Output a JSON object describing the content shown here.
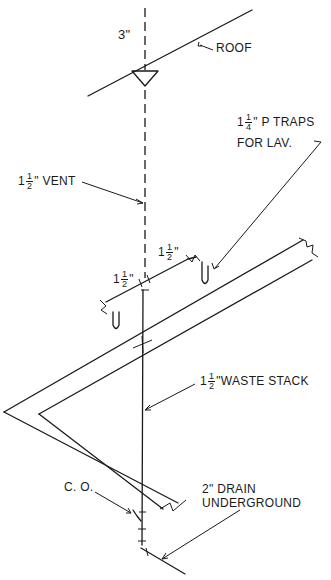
{
  "diagram": {
    "type": "isometric plumbing riser diagram",
    "labels": {
      "vent_top_size": "3\"",
      "roof": "ROOF",
      "p_traps": {
        "whole": "1",
        "num": "1",
        "den": "4",
        "inch": "\"",
        "text": "P TRAPS",
        "line2": "FOR LAV."
      },
      "vent": {
        "whole": "1",
        "num": "1",
        "den": "2",
        "inch": "\"",
        "text": "VENT"
      },
      "branch_left": {
        "whole": "1",
        "num": "1",
        "den": "2",
        "inch": "\""
      },
      "branch_right": {
        "whole": "1",
        "num": "1",
        "den": "2",
        "inch": "\""
      },
      "waste_stack": {
        "whole": "1",
        "num": "1",
        "den": "2",
        "inch": "\"",
        "text": "WASTE STACK"
      },
      "cleanout": "C. O.",
      "drain": {
        "line1": "2\" DRAIN",
        "line2": "UNDERGROUND"
      }
    },
    "colors": {
      "ink": "#1a1a1a",
      "paper": "#ffffff"
    }
  }
}
